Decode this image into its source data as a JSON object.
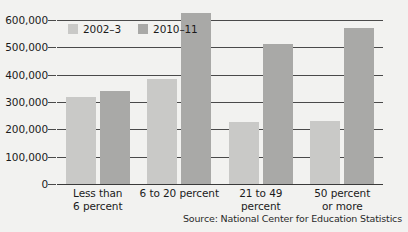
{
  "chart_data": {
    "type": "bar",
    "title": "",
    "subtitle": "",
    "xlabel": "",
    "ylabel": "",
    "categories": [
      "Less than\n6 percent",
      "6 to 20 percent",
      "21 to 49\npercent",
      "50 percent\nor more"
    ],
    "series": [
      {
        "name": "2002–3",
        "color": "#c9c9c7",
        "values": [
          320000,
          385000,
          228000,
          232000
        ]
      },
      {
        "name": "2010–11",
        "color": "#a9a9a7",
        "values": [
          340000,
          625000,
          512000,
          570000
        ]
      }
    ],
    "ylim": [
      0,
      600000
    ],
    "yticks": [
      0,
      100000,
      200000,
      300000,
      400000,
      500000,
      600000
    ],
    "ytick_labels": [
      "0",
      "100,000",
      "200,000",
      "300,000",
      "400,000",
      "500,000",
      "600,000"
    ],
    "grid": true,
    "legend_position": "top-left",
    "source": "Source: National Center for Education Statistics"
  }
}
